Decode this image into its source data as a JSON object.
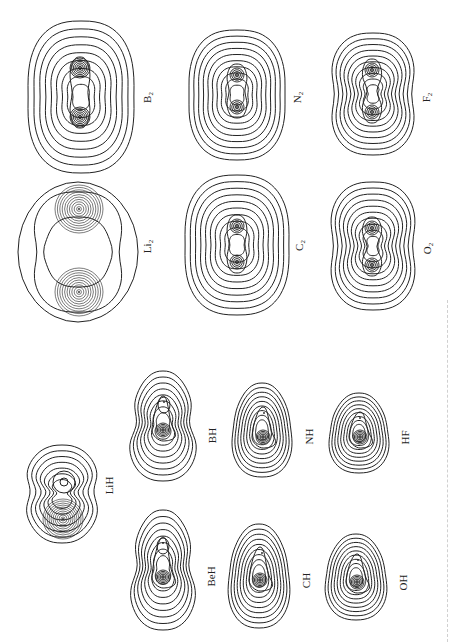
{
  "figure": {
    "line_color": "#222222",
    "background": "#ffffff"
  },
  "molecules": [
    {
      "id": "B2",
      "formula": "B",
      "subscript": "2",
      "group": "homonuclear",
      "cx": 81,
      "cy": 97,
      "rx": 54,
      "ry": 76,
      "nuclei": [
        [
          80,
          68
        ],
        [
          80,
          117
        ]
      ],
      "contours": 9,
      "shape": "oval"
    },
    {
      "id": "N2",
      "formula": "N",
      "subscript": "2",
      "group": "homonuclear",
      "cx": 237,
      "cy": 95,
      "rx": 49,
      "ry": 65,
      "nuclei": [
        [
          237,
          75
        ],
        [
          237,
          107
        ]
      ],
      "contours": 10,
      "shape": "oval"
    },
    {
      "id": "F2",
      "formula": "F",
      "subscript": "2",
      "group": "homonuclear",
      "cx": 373,
      "cy": 94,
      "rx": 44,
      "ry": 61,
      "nuclei": [
        [
          372,
          70
        ],
        [
          372,
          112
        ]
      ],
      "contours": 10,
      "shape": "peanut"
    },
    {
      "id": "Li2",
      "formula": "Li",
      "subscript": "2",
      "group": "homonuclear",
      "cx": 78,
      "cy": 252,
      "rx": 60,
      "ry": 70,
      "nuclei": [
        [
          79,
          209
        ],
        [
          79,
          292
        ]
      ],
      "contours": 3,
      "shape": "li2"
    },
    {
      "id": "C2",
      "formula": "C",
      "subscript": "2",
      "group": "homonuclear",
      "cx": 237,
      "cy": 245,
      "rx": 53,
      "ry": 70,
      "nuclei": [
        [
          237,
          226
        ],
        [
          237,
          262
        ]
      ],
      "contours": 10,
      "shape": "oval"
    },
    {
      "id": "O2",
      "formula": "O",
      "subscript": "2",
      "group": "homonuclear",
      "cx": 373,
      "cy": 246,
      "rx": 45,
      "ry": 64,
      "nuclei": [
        [
          372,
          228
        ],
        [
          372,
          265
        ]
      ],
      "contours": 10,
      "shape": "peanut"
    },
    {
      "id": "LiH",
      "formula": "LiH",
      "subscript": "",
      "group": "hydride",
      "cx": 62,
      "cy": 494,
      "rx": 38,
      "ry": 49,
      "nuclei": [
        [
          64,
          482
        ],
        [
          63,
          519
        ]
      ],
      "contours": 7,
      "shape": "lih"
    },
    {
      "id": "BH",
      "formula": "BH",
      "subscript": "",
      "group": "hydride",
      "cx": 163,
      "cy": 426,
      "rx": 40,
      "ry": 55,
      "nuclei": [
        [
          164,
          402
        ],
        [
          163,
          430
        ]
      ],
      "contours": 8,
      "shape": "hydride"
    },
    {
      "id": "NH",
      "formula": "NH",
      "subscript": "",
      "group": "hydride",
      "cx": 262,
      "cy": 430,
      "rx": 35,
      "ry": 47,
      "nuclei": [
        [
          264,
          413
        ],
        [
          263,
          437
        ]
      ],
      "contours": 9,
      "shape": "hydride"
    },
    {
      "id": "HF",
      "formula": "HF",
      "subscript": "",
      "group": "hydride",
      "cx": 359,
      "cy": 433,
      "rx": 35,
      "ry": 40,
      "nuclei": [
        [
          360,
          418
        ],
        [
          360,
          437
        ]
      ],
      "contours": 9,
      "shape": "hydride"
    },
    {
      "id": "BeH",
      "formula": "BeH",
      "subscript": "",
      "group": "hydride",
      "cx": 163,
      "cy": 570,
      "rx": 39,
      "ry": 60,
      "nuclei": [
        [
          163,
          543
        ],
        [
          163,
          577
        ]
      ],
      "contours": 8,
      "shape": "hydride"
    },
    {
      "id": "CH",
      "formula": "CH",
      "subscript": "",
      "group": "hydride",
      "cx": 259,
      "cy": 576,
      "rx": 36,
      "ry": 52,
      "nuclei": [
        [
          262,
          553
        ],
        [
          260,
          580
        ]
      ],
      "contours": 9,
      "shape": "hydride"
    },
    {
      "id": "OH",
      "formula": "OH",
      "subscript": "",
      "group": "hydride",
      "cx": 356,
      "cy": 577,
      "rx": 36,
      "ry": 43,
      "nuclei": [
        [
          358,
          560
        ],
        [
          357,
          582
        ]
      ],
      "contours": 9,
      "shape": "hydride"
    }
  ],
  "labels": [
    {
      "id": "B2",
      "text": "B",
      "sub": "2",
      "x": 148,
      "y": 97
    },
    {
      "id": "N2",
      "text": "N",
      "sub": "2",
      "x": 298,
      "y": 97
    },
    {
      "id": "F2",
      "text": "F",
      "sub": "2",
      "x": 428,
      "y": 97
    },
    {
      "id": "Li2",
      "text": "Li",
      "sub": "2",
      "x": 148,
      "y": 246
    },
    {
      "id": "C2",
      "text": "C",
      "sub": "2",
      "x": 300,
      "y": 245
    },
    {
      "id": "O2",
      "text": "O",
      "sub": "2",
      "x": 428,
      "y": 248
    },
    {
      "id": "LiH",
      "text": "LiH",
      "sub": "",
      "x": 110,
      "y": 485
    },
    {
      "id": "BH",
      "text": "BH",
      "sub": "",
      "x": 212,
      "y": 435
    },
    {
      "id": "NH",
      "text": "NH",
      "sub": "",
      "x": 310,
      "y": 436
    },
    {
      "id": "HF",
      "text": "HF",
      "sub": "",
      "x": 405,
      "y": 437
    },
    {
      "id": "BeH",
      "text": "BeH",
      "sub": "",
      "x": 211,
      "y": 576
    },
    {
      "id": "CH",
      "text": "CH",
      "sub": "",
      "x": 306,
      "y": 580
    },
    {
      "id": "OH",
      "text": "OH",
      "sub": "",
      "x": 404,
      "y": 582
    }
  ]
}
